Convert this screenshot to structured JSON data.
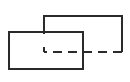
{
  "canvas": {
    "width": 130,
    "height": 82,
    "background_color": "#ffffff"
  },
  "stroke": {
    "color": "#2a2a2a",
    "width": 2,
    "dash_pattern": "9 6"
  },
  "shapes": {
    "front_rectangle": {
      "description": "front overlapping rectangle, all edges solid",
      "style": "solid",
      "d": "M 9 32 H 83 V 69 H 9 Z"
    },
    "back_rectangle_visible": {
      "description": "back rectangle visible edges: left tick, top edge, right edge",
      "style": "solid",
      "d": "M 44 34 V 16 H 122 V 52"
    },
    "back_rectangle_hidden_bottom": {
      "description": "back rectangle bottom edge hidden behind front rectangle, dashed",
      "style": "dashed",
      "d": "M 122 52 H 44"
    },
    "back_rectangle_hidden_left": {
      "description": "back rectangle lower-left edge hidden behind front rectangle, dashed",
      "style": "dashed",
      "d": "M 44 52 V 36"
    }
  }
}
